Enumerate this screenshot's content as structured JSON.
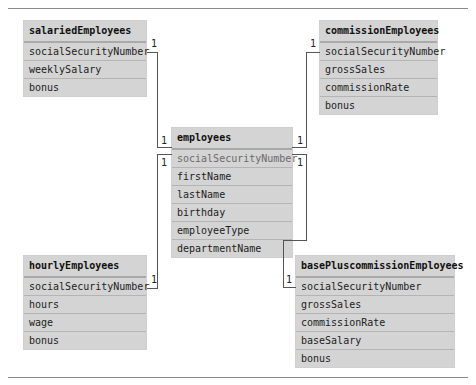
{
  "diagram": {
    "type": "entity-relationship",
    "tables": {
      "salaried": {
        "name": "salariedEmployees",
        "fields": [
          "socialSecurityNumber",
          "weeklySalary",
          "bonus"
        ]
      },
      "employees": {
        "name": "employees",
        "fields": [
          "socialSecurityNumber",
          "firstName",
          "lastName",
          "birthday",
          "employeeType",
          "departmentName"
        ]
      },
      "commission": {
        "name": "commissionEmployees",
        "fields": [
          "socialSecurityNumber",
          "grossSales",
          "commissionRate",
          "bonus"
        ]
      },
      "hourly": {
        "name": "hourlyEmployees",
        "fields": [
          "socialSecurityNumber",
          "hours",
          "wage",
          "bonus"
        ]
      },
      "basePlus": {
        "name": "basePluscommissionEmployees",
        "fields": [
          "socialSecurityNumber",
          "grossSales",
          "commissionRate",
          "baseSalary",
          "bonus"
        ]
      }
    },
    "relationships": [
      {
        "from": "salariedEmployees.socialSecurityNumber",
        "to": "employees.socialSecurityNumber",
        "from_card": "1",
        "to_card": "1"
      },
      {
        "from": "hourlyEmployees.socialSecurityNumber",
        "to": "employees.socialSecurityNumber",
        "from_card": "1",
        "to_card": "1"
      },
      {
        "from": "commissionEmployees.socialSecurityNumber",
        "to": "employees.socialSecurityNumber",
        "from_card": "1",
        "to_card": "1"
      },
      {
        "from": "basePluscommissionEmployees.socialSecurityNumber",
        "to": "employees.socialSecurityNumber",
        "from_card": "1",
        "to_card": "1"
      }
    ],
    "cardinality_label": "1"
  }
}
